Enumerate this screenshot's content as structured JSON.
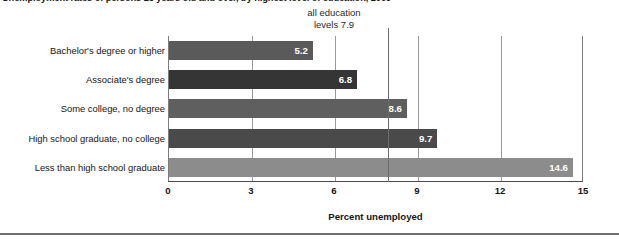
{
  "chart_data": {
    "type": "bar",
    "orientation": "horizontal",
    "title": "Unemployment rates of persons 25 years old and over, by highest level of education, 2009",
    "xlabel": "Percent unemployed",
    "ylabel": "",
    "xlim": [
      0,
      15
    ],
    "xticks": [
      0,
      3,
      6,
      9,
      12,
      15
    ],
    "xtick_labels": [
      "0",
      "3",
      "6",
      "9",
      "12",
      "15"
    ],
    "grid": true,
    "legend": "none",
    "categories": [
      "Bachelor's degree or higher",
      "Associate's degree",
      "Some college, no degree",
      "High school graduate, no college",
      "Less than high school graduate"
    ],
    "values": [
      5.2,
      6.8,
      8.6,
      9.7,
      14.6
    ],
    "value_labels": [
      "5.2",
      "6.8",
      "8.6",
      "9.7",
      "14.6"
    ],
    "bar_colors": [
      "#5a5a5a",
      "#353535",
      "#5f5f5f",
      "#4a4a4a",
      "#8c8c8c"
    ],
    "annotations": [
      {
        "text_line_1": "all education",
        "text_line_2": "levels 7.9",
        "value": 7.9,
        "type": "reference-line"
      }
    ]
  },
  "title": {
    "text": "Unemployment rates of persons 25 years old and over, by highest level of education, 2009"
  },
  "annotation": {
    "line1": "all education",
    "line2": "levels 7.9"
  },
  "axis": {
    "x_title": "Percent unemployed",
    "ticks": [
      "0",
      "3",
      "6",
      "9",
      "12",
      "15"
    ]
  },
  "bars": [
    {
      "label": "Bachelor's degree or higher",
      "value": "5.2"
    },
    {
      "label": "Associate's degree",
      "value": "6.8"
    },
    {
      "label": "Some college, no degree",
      "value": "8.6"
    },
    {
      "label": "High school graduate, no college",
      "value": "9.7"
    },
    {
      "label": "Less than high school graduate",
      "value": "14.6"
    }
  ]
}
